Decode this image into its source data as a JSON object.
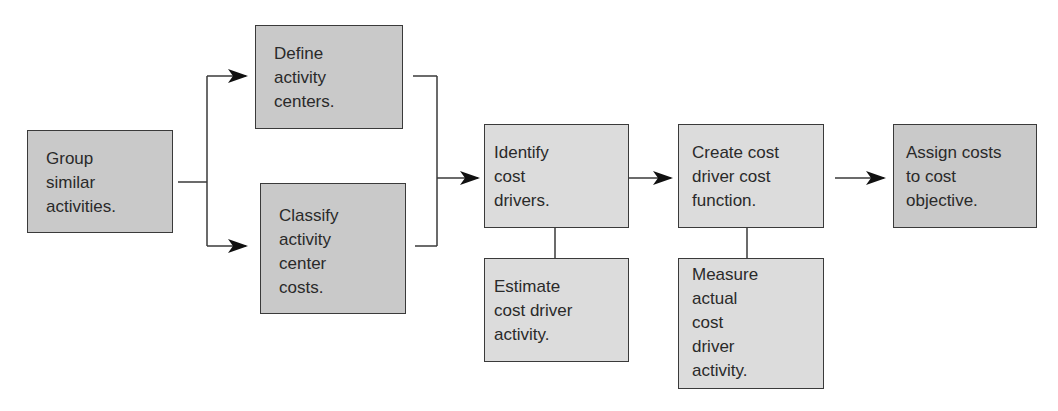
{
  "diagram": {
    "type": "flowchart",
    "nodes": [
      {
        "id": "group",
        "lines": [
          "Group",
          "similar",
          "activities."
        ],
        "shade": "dark"
      },
      {
        "id": "define",
        "lines": [
          "Define",
          "activity",
          "centers."
        ],
        "shade": "dark"
      },
      {
        "id": "classify",
        "lines": [
          "Classify",
          "activity",
          "center",
          "costs."
        ],
        "shade": "dark"
      },
      {
        "id": "identify",
        "lines": [
          "Identify",
          "cost",
          "drivers."
        ],
        "shade": "light"
      },
      {
        "id": "estimate",
        "lines": [
          "Estimate",
          "cost driver",
          "activity."
        ],
        "shade": "light"
      },
      {
        "id": "create",
        "lines": [
          "Create cost",
          "driver cost",
          "function."
        ],
        "shade": "light"
      },
      {
        "id": "measure",
        "lines": [
          "Measure",
          "actual",
          "cost",
          "driver",
          "activity."
        ],
        "shade": "light"
      },
      {
        "id": "assign",
        "lines": [
          "Assign costs",
          "to cost",
          "objective."
        ],
        "shade": "dark"
      }
    ],
    "edges": [
      {
        "from": "group",
        "to": "define",
        "type": "arrow"
      },
      {
        "from": "group",
        "to": "classify",
        "type": "arrow"
      },
      {
        "from": "define",
        "to": "identify",
        "type": "arrow"
      },
      {
        "from": "classify",
        "to": "identify",
        "type": "arrow"
      },
      {
        "from": "identify",
        "to": "estimate",
        "type": "line"
      },
      {
        "from": "identify",
        "to": "create",
        "type": "arrow"
      },
      {
        "from": "create",
        "to": "measure",
        "type": "line"
      },
      {
        "from": "create",
        "to": "assign",
        "type": "arrow"
      }
    ],
    "colors": {
      "dark_fill": "#c9c9c9",
      "light_fill": "#dcdcdc",
      "stroke": "#3a3a3a",
      "text": "#2a2a2a"
    }
  }
}
